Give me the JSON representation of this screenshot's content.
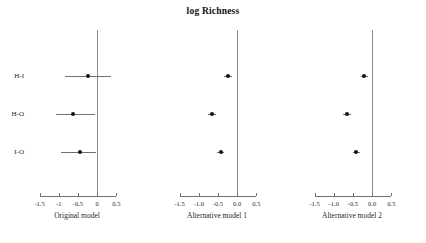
{
  "chart_data": {
    "type": "scatter",
    "plot_kind": "forest-plot",
    "title": "log Richness",
    "xlabel": "",
    "ylabel": "",
    "categories": [
      "H-I",
      "H-O",
      "I-O"
    ],
    "xlim": [
      -1.75,
      0.7
    ],
    "grid": false,
    "legend": null,
    "reference_line": 0,
    "panels": [
      {
        "caption": "Original model",
        "xticks": [
          -1.5,
          -1,
          -0.5,
          0,
          0.5
        ],
        "xticklabels": [
          "-1.5",
          "-1",
          "-0.5",
          "0",
          "0.5"
        ],
        "points": [
          {
            "category": "H-I",
            "estimate": -0.25,
            "ci_low": -0.85,
            "ci_high": 0.35
          },
          {
            "category": "H-O",
            "estimate": -0.62,
            "ci_low": -1.08,
            "ci_high": -0.05
          },
          {
            "category": "I-O",
            "estimate": -0.45,
            "ci_low": -0.95,
            "ci_high": -0.02
          }
        ]
      },
      {
        "caption": "Alternative model 1",
        "xticks": [
          -1.5,
          -1.0,
          -0.5,
          0.0,
          0.5
        ],
        "xticklabels": [
          "-1.5",
          "-1.0",
          "-0.5",
          "0.0",
          "0.5"
        ],
        "points": [
          {
            "category": "H-I",
            "estimate": -0.25,
            "ci_low": -0.34,
            "ci_high": -0.14
          },
          {
            "category": "H-O",
            "estimate": -0.66,
            "ci_low": -0.76,
            "ci_high": -0.56
          },
          {
            "category": "I-O",
            "estimate": -0.43,
            "ci_low": -0.52,
            "ci_high": -0.33
          }
        ]
      },
      {
        "caption": "Alternative model 2",
        "xticks": [
          -1.5,
          -1.0,
          -0.5,
          0.0,
          0.5
        ],
        "xticklabels": [
          "-1.5",
          "-1.0",
          "-0.5",
          "0.0",
          "0.5"
        ],
        "points": [
          {
            "category": "H-I",
            "estimate": -0.21,
            "ci_low": -0.3,
            "ci_high": -0.11
          },
          {
            "category": "H-O",
            "estimate": -0.66,
            "ci_low": -0.76,
            "ci_high": -0.56
          },
          {
            "category": "I-O",
            "estimate": -0.42,
            "ci_low": -0.51,
            "ci_high": -0.32
          }
        ]
      }
    ],
    "colors": {
      "point": "#151515",
      "ci": "#6f6f6f",
      "axis": "#6f6f6f",
      "zero_line": "#8a8a8a",
      "text": "#1a1a1a",
      "background": "#ffffff"
    }
  }
}
